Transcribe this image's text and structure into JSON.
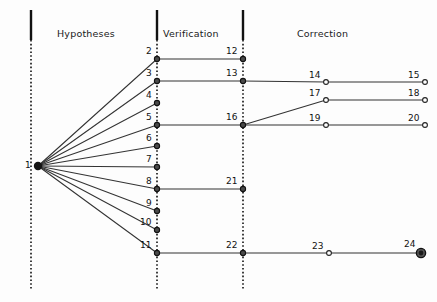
{
  "figure": {
    "background_color": "#fdfdfd",
    "stroke_color": "#333333",
    "text_color": "#111111",
    "width": 437,
    "height": 302
  },
  "phases": [
    {
      "id": "hypotheses",
      "label": "Hypotheses",
      "divider_x": 31,
      "label_x": 57,
      "label_y": 28
    },
    {
      "id": "verification",
      "label": "Verification",
      "divider_x": 157,
      "label_x": 163,
      "label_y": 28
    },
    {
      "id": "correction",
      "label": "Correction",
      "divider_x": 243,
      "label_x": 297,
      "label_y": 28
    }
  ],
  "dividers": [
    {
      "name": "divider-hypotheses",
      "x": 31,
      "solid_top": 10,
      "solid_bottom": 40,
      "dotted_bottom": 290
    },
    {
      "name": "divider-verification",
      "x": 157,
      "solid_top": 10,
      "solid_bottom": 40,
      "dotted_bottom": 290
    },
    {
      "name": "divider-correction",
      "x": 243,
      "solid_top": 10,
      "solid_bottom": 40,
      "dotted_bottom": 290
    }
  ],
  "chart_data": {
    "type": "diagram",
    "title": "",
    "nodes": [
      {
        "id": "1",
        "label": "1",
        "x": 38,
        "y": 166,
        "style": "root",
        "radius": 4.2,
        "label_dx": -13,
        "label_dy": -6
      },
      {
        "id": "2",
        "label": "2",
        "x": 157,
        "y": 59,
        "style": "filled",
        "radius": 2.6,
        "label_dx": -11,
        "label_dy": -13
      },
      {
        "id": "3",
        "label": "3",
        "x": 157,
        "y": 81,
        "style": "filled",
        "radius": 2.6,
        "label_dx": -11,
        "label_dy": -13
      },
      {
        "id": "4",
        "label": "4",
        "x": 157,
        "y": 103,
        "style": "filled",
        "radius": 2.6,
        "label_dx": -11,
        "label_dy": -13
      },
      {
        "id": "5",
        "label": "5",
        "x": 157,
        "y": 125,
        "style": "filled",
        "radius": 2.6,
        "label_dx": -11,
        "label_dy": -13
      },
      {
        "id": "6",
        "label": "6",
        "x": 157,
        "y": 146,
        "style": "filled",
        "radius": 2.6,
        "label_dx": -11,
        "label_dy": -13
      },
      {
        "id": "7",
        "label": "7",
        "x": 157,
        "y": 167,
        "style": "filled",
        "radius": 2.6,
        "label_dx": -11,
        "label_dy": -13
      },
      {
        "id": "8",
        "label": "8",
        "x": 157,
        "y": 189,
        "style": "filled",
        "radius": 2.6,
        "label_dx": -11,
        "label_dy": -13
      },
      {
        "id": "9",
        "label": "9",
        "x": 157,
        "y": 211,
        "style": "filled",
        "radius": 2.6,
        "label_dx": -11,
        "label_dy": -13
      },
      {
        "id": "10",
        "label": "10",
        "x": 157,
        "y": 230,
        "style": "filled",
        "radius": 2.6,
        "label_dx": -17,
        "label_dy": -13
      },
      {
        "id": "11",
        "label": "11",
        "x": 157,
        "y": 253,
        "style": "filled",
        "radius": 2.6,
        "label_dx": -17,
        "label_dy": -13
      },
      {
        "id": "12",
        "label": "12",
        "x": 243,
        "y": 59,
        "style": "filled",
        "radius": 2.6,
        "label_dx": -17,
        "label_dy": -13
      },
      {
        "id": "13",
        "label": "13",
        "x": 243,
        "y": 81,
        "style": "filled",
        "radius": 2.6,
        "label_dx": -17,
        "label_dy": -13
      },
      {
        "id": "16",
        "label": "16",
        "x": 243,
        "y": 125,
        "style": "filled",
        "radius": 2.6,
        "label_dx": -17,
        "label_dy": -13
      },
      {
        "id": "21",
        "label": "21",
        "x": 243,
        "y": 189,
        "style": "filled",
        "radius": 2.6,
        "label_dx": -17,
        "label_dy": -13
      },
      {
        "id": "22",
        "label": "22",
        "x": 243,
        "y": 253,
        "style": "filled",
        "radius": 2.6,
        "label_dx": -17,
        "label_dy": -13
      },
      {
        "id": "14",
        "label": "14",
        "x": 326,
        "y": 82,
        "style": "hollow",
        "radius": 2.4,
        "label_dx": -17,
        "label_dy": -12
      },
      {
        "id": "15",
        "label": "15",
        "x": 425,
        "y": 82,
        "style": "hollow",
        "radius": 2.4,
        "label_dx": -17,
        "label_dy": -12
      },
      {
        "id": "17",
        "label": "17",
        "x": 326,
        "y": 100,
        "style": "hollow",
        "radius": 2.4,
        "label_dx": -17,
        "label_dy": -12
      },
      {
        "id": "18",
        "label": "18",
        "x": 425,
        "y": 100,
        "style": "hollow",
        "radius": 2.4,
        "label_dx": -17,
        "label_dy": -12
      },
      {
        "id": "19",
        "label": "19",
        "x": 326,
        "y": 125,
        "style": "hollow",
        "radius": 2.4,
        "label_dx": -17,
        "label_dy": -12
      },
      {
        "id": "20",
        "label": "20",
        "x": 425,
        "y": 125,
        "style": "hollow",
        "radius": 2.4,
        "label_dx": -17,
        "label_dy": -12
      },
      {
        "id": "23",
        "label": "23",
        "x": 329,
        "y": 253,
        "style": "hollow",
        "radius": 2.4,
        "label_dx": -17,
        "label_dy": -12
      },
      {
        "id": "24",
        "label": "24",
        "x": 421,
        "y": 253,
        "style": "terminal",
        "radius": 4.6,
        "label_dx": -17,
        "label_dy": -14
      }
    ],
    "edges": [
      {
        "from": "1",
        "to": "2"
      },
      {
        "from": "1",
        "to": "3"
      },
      {
        "from": "1",
        "to": "4"
      },
      {
        "from": "1",
        "to": "5"
      },
      {
        "from": "1",
        "to": "6"
      },
      {
        "from": "1",
        "to": "7"
      },
      {
        "from": "1",
        "to": "8"
      },
      {
        "from": "1",
        "to": "9"
      },
      {
        "from": "1",
        "to": "10"
      },
      {
        "from": "1",
        "to": "11"
      },
      {
        "from": "2",
        "to": "12"
      },
      {
        "from": "3",
        "to": "13"
      },
      {
        "from": "5",
        "to": "16"
      },
      {
        "from": "8",
        "to": "21"
      },
      {
        "from": "11",
        "to": "22"
      },
      {
        "from": "13",
        "to": "14"
      },
      {
        "from": "14",
        "to": "15"
      },
      {
        "from": "16",
        "to": "17"
      },
      {
        "from": "17",
        "to": "18"
      },
      {
        "from": "16",
        "to": "19"
      },
      {
        "from": "19",
        "to": "20"
      },
      {
        "from": "22",
        "to": "23"
      },
      {
        "from": "23",
        "to": "24"
      }
    ]
  }
}
